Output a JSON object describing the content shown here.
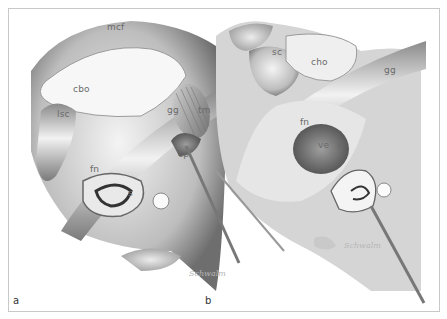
{
  "figure": {
    "panels": [
      {
        "id": "a",
        "panel_label": "a",
        "labels": [
          {
            "text": "mcf",
            "x": 106,
            "y": 29
          },
          {
            "text": "cbo",
            "x": 72,
            "y": 86
          },
          {
            "text": "lsc",
            "x": 56,
            "y": 105
          },
          {
            "text": "gg",
            "x": 166,
            "y": 98
          },
          {
            "text": "tm",
            "x": 197,
            "y": 97
          },
          {
            "text": "cp",
            "x": 176,
            "y": 141
          },
          {
            "text": "fn",
            "x": 89,
            "y": 157
          },
          {
            "text": "s",
            "x": 126,
            "y": 185
          }
        ],
        "signature": "Schwalm"
      },
      {
        "id": "b",
        "panel_label": "b",
        "labels": [
          {
            "text": "sc",
            "x": 271,
            "y": 47
          },
          {
            "text": "cho",
            "x": 310,
            "y": 55
          },
          {
            "text": "gg",
            "x": 383,
            "y": 63
          },
          {
            "text": "fn",
            "x": 299,
            "y": 117
          },
          {
            "text": "ve",
            "x": 316,
            "y": 139
          },
          {
            "text": "s",
            "x": 336,
            "y": 139
          }
        ],
        "signature": "Schwalm"
      }
    ]
  }
}
